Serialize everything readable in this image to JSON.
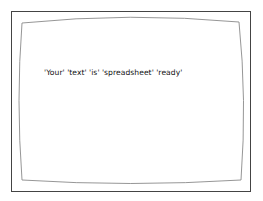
{
  "screen": {
    "message": "'Your' 'text' 'is' 'spreadsheet' 'ready'",
    "colors": {
      "background": "#ffffff",
      "outer_border": "#444444",
      "inner_border": "#888888",
      "text": "#111111"
    }
  }
}
